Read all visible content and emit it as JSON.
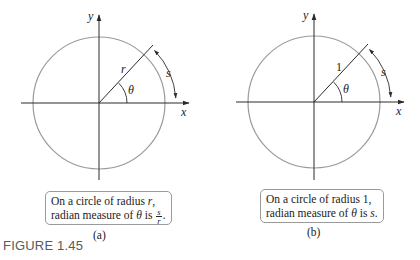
{
  "figure": {
    "label": "FIGURE 1.45",
    "colors": {
      "circle": "#9a9a9a",
      "axes": "#2a2a2a",
      "text": "#222222",
      "box_border": "#9a9a9a",
      "figure_label": "#5a5a5a"
    }
  },
  "panels": [
    {
      "id": "a",
      "sublabel": "(a)",
      "axis_x_label": "x",
      "axis_y_label": "y",
      "radius_label": "r",
      "angle_label": "θ",
      "arc_label": "s",
      "caption": {
        "line1_prefix": "On a circle of radius ",
        "line1_var": "r",
        "line1_suffix": ",",
        "line2_prefix": "radian measure of ",
        "line2_theta": "θ",
        "line2_is": " is ",
        "frac_num": "s",
        "frac_den": "r",
        "line2_suffix": "."
      }
    },
    {
      "id": "b",
      "sublabel": "(b)",
      "axis_x_label": "x",
      "axis_y_label": "y",
      "radius_label": "1",
      "angle_label": "θ",
      "arc_label": "s",
      "caption": {
        "line1_prefix": "On a circle of radius 1,",
        "line2_prefix": "radian measure of ",
        "line2_theta": "θ",
        "line2_is": " is ",
        "line2_var": "s",
        "line2_suffix": "."
      }
    }
  ]
}
